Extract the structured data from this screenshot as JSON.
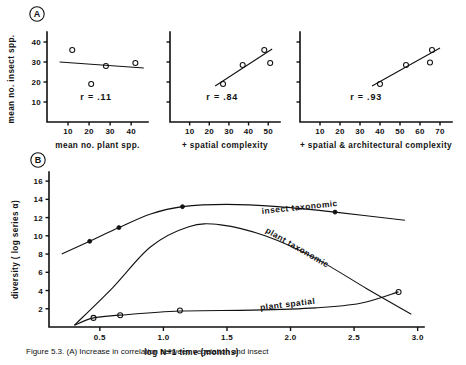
{
  "figure": {
    "caption": "Figure 5.3.   (A) Increase in correlation between vegetation and insect",
    "panel_a_label": "A",
    "panel_b_label": "B"
  },
  "panel_a": {
    "y_axis_label": "mean no. insect spp.",
    "y_ticks": [
      10,
      20,
      30,
      40
    ],
    "y_range": [
      0,
      45
    ],
    "plots": [
      {
        "x_axis_label": "mean no. plant spp.",
        "r_text": "r = .11",
        "r_value": 0.11,
        "x_ticks": [
          10,
          20,
          30,
          40
        ],
        "x_range": [
          0,
          48
        ],
        "points": [
          {
            "x": 12,
            "y": 36
          },
          {
            "x": 21,
            "y": 19
          },
          {
            "x": 28,
            "y": 28
          },
          {
            "x": 42,
            "y": 29.5
          }
        ],
        "fit_line": {
          "x1": 6,
          "y1": 30,
          "x2": 46,
          "y2": 27
        }
      },
      {
        "x_axis_label": "+ spatial complexity",
        "r_text": "r = .84",
        "r_value": 0.84,
        "x_ticks": [
          10,
          20,
          30,
          40,
          50
        ],
        "x_range": [
          0,
          56
        ],
        "points": [
          {
            "x": 27,
            "y": 19
          },
          {
            "x": 37,
            "y": 28.5
          },
          {
            "x": 48,
            "y": 36
          },
          {
            "x": 51,
            "y": 29.5
          }
        ],
        "fit_line": {
          "x1": 23,
          "y1": 18,
          "x2": 52,
          "y2": 36.5
        }
      },
      {
        "x_axis_label": "+ spatial & architectural complexity",
        "r_text": "r = .93",
        "r_value": 0.93,
        "x_ticks": [
          10,
          20,
          30,
          40,
          50,
          60,
          70
        ],
        "x_range": [
          0,
          76
        ],
        "points": [
          {
            "x": 40,
            "y": 19
          },
          {
            "x": 53,
            "y": 28.5
          },
          {
            "x": 65,
            "y": 29.8
          },
          {
            "x": 66,
            "y": 36
          }
        ],
        "fit_line": {
          "x1": 36,
          "y1": 18,
          "x2": 70,
          "y2": 37
        }
      }
    ]
  },
  "panel_b": {
    "y_axis_label": "diversity ( log series α)",
    "x_axis_label": "log N+1 time  (months)",
    "y_ticks": [
      2,
      4,
      6,
      8,
      10,
      12,
      14,
      16
    ],
    "y_range": [
      0,
      17
    ],
    "x_ticks": [
      "0.5",
      "1.0",
      "1.5",
      "2.0",
      "2.5",
      "3.0"
    ],
    "x_tick_values": [
      0.5,
      1.0,
      1.5,
      2.0,
      2.5,
      3.0
    ],
    "x_range": [
      0.1,
      3.05
    ],
    "series": [
      {
        "name": "insect taxonomic",
        "label": "insect taxonomic",
        "marker": "filled-circle",
        "points": [
          {
            "x": 0.42,
            "y": 9.4
          },
          {
            "x": 0.65,
            "y": 10.9
          },
          {
            "x": 1.15,
            "y": 13.2
          },
          {
            "x": 2.35,
            "y": 12.6
          }
        ],
        "curve": [
          {
            "x": 0.2,
            "y": 8.0
          },
          {
            "x": 0.42,
            "y": 9.4
          },
          {
            "x": 0.65,
            "y": 10.9
          },
          {
            "x": 0.9,
            "y": 12.4
          },
          {
            "x": 1.15,
            "y": 13.2
          },
          {
            "x": 1.5,
            "y": 13.45
          },
          {
            "x": 1.9,
            "y": 13.2
          },
          {
            "x": 2.35,
            "y": 12.6
          },
          {
            "x": 2.9,
            "y": 11.7
          }
        ]
      },
      {
        "name": "plant taxonomic",
        "label": "plant taxonomic",
        "marker": "none",
        "points": [],
        "curve": [
          {
            "x": 0.3,
            "y": 0.2
          },
          {
            "x": 0.6,
            "y": 4.3
          },
          {
            "x": 0.9,
            "y": 8.8
          },
          {
            "x": 1.2,
            "y": 11.0
          },
          {
            "x": 1.45,
            "y": 11.2
          },
          {
            "x": 1.8,
            "y": 10.0
          },
          {
            "x": 2.2,
            "y": 7.5
          },
          {
            "x": 2.6,
            "y": 4.2
          },
          {
            "x": 2.95,
            "y": 1.4
          }
        ]
      },
      {
        "name": "plant spatial",
        "label": "plant spatial",
        "marker": "open-circle",
        "points": [
          {
            "x": 0.45,
            "y": 1.0
          },
          {
            "x": 0.66,
            "y": 1.3
          },
          {
            "x": 1.13,
            "y": 1.8
          },
          {
            "x": 2.85,
            "y": 3.85
          }
        ],
        "curve": [
          {
            "x": 0.3,
            "y": 0.2
          },
          {
            "x": 0.45,
            "y": 1.0
          },
          {
            "x": 0.66,
            "y": 1.3
          },
          {
            "x": 1.13,
            "y": 1.75
          },
          {
            "x": 1.7,
            "y": 1.85
          },
          {
            "x": 2.2,
            "y": 2.1
          },
          {
            "x": 2.55,
            "y": 2.6
          },
          {
            "x": 2.85,
            "y": 3.85
          }
        ]
      }
    ]
  }
}
